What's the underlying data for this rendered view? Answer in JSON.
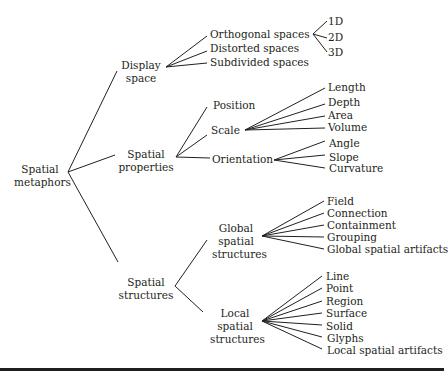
{
  "diagram": {
    "root": "Spatial metaphors",
    "nodes": {
      "root": [
        "Spatial",
        "metaphors"
      ],
      "display_space": [
        "Display",
        "space"
      ],
      "spatial_properties": [
        "Spatial",
        "properties"
      ],
      "spatial_structures": [
        "Spatial",
        "structures"
      ],
      "global_structures": [
        "Global",
        "spatial",
        "structures"
      ],
      "local_structures": [
        "Local",
        "spatial",
        "structures"
      ]
    },
    "display_space_children": [
      "Orthogonal spaces",
      "Distorted spaces",
      "Subdivided spaces"
    ],
    "orthogonal_children": [
      "1D",
      "2D",
      "3D"
    ],
    "spatial_properties_children": [
      "Position",
      "Scale",
      "Orientation"
    ],
    "scale_children": [
      "Length",
      "Depth",
      "Area",
      "Volume"
    ],
    "orientation_children": [
      "Angle",
      "Slope",
      "Curvature"
    ],
    "global_children": [
      "Field",
      "Connection",
      "Containment",
      "Grouping",
      "Global spatial artifacts"
    ],
    "local_children": [
      "Line",
      "Point",
      "Region",
      "Surface",
      "Solid",
      "Glyphs",
      "Local spatial artifacts"
    ]
  }
}
